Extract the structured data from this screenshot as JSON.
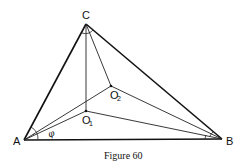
{
  "figure": {
    "caption": "Figure 60",
    "points": {
      "A": {
        "label": "A",
        "x": 24,
        "y": 140
      },
      "B": {
        "label": "B",
        "x": 222,
        "y": 139
      },
      "C": {
        "label": "C",
        "x": 86,
        "y": 24
      },
      "O1": {
        "label": "O",
        "subscript": "1",
        "x": 86,
        "y": 111
      },
      "O2": {
        "label": "O",
        "subscript": "2",
        "x": 111,
        "y": 86
      }
    },
    "angle_label": "φ"
  }
}
